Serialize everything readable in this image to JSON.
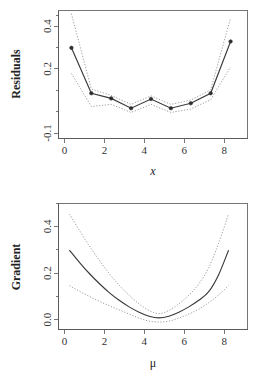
{
  "figure": {
    "panels": 2,
    "background": "#ffffff",
    "line_color": "#3a3a3a",
    "band_color": "#8a8a8a"
  },
  "chart_data": [
    {
      "type": "line",
      "panel_name": "residuals-panel",
      "title": "",
      "xlabel": "x",
      "ylabel": "Residuals",
      "xlim": [
        -0.55,
        8.95
      ],
      "ylim": [
        -0.13,
        0.47
      ],
      "grid": false,
      "legend": "none",
      "xticks": [
        0,
        2,
        4,
        6,
        8
      ],
      "xticklabels": [
        "0",
        "2",
        "4",
        "6",
        "8"
      ],
      "yticks": [
        -0.1,
        0.2,
        0.4
      ],
      "yticklabels": [
        "-0.1",
        "0.2",
        "0.4"
      ],
      "yticks_minor": [
        0.0,
        0.1,
        0.3
      ],
      "markers": "filled-circle",
      "x": [
        0.1,
        1.1,
        2.1,
        3.1,
        4.1,
        5.1,
        6.1,
        7.1,
        8.1
      ],
      "series": [
        {
          "name": "residuals",
          "style": "solid",
          "values": [
            0.295,
            0.082,
            0.058,
            0.012,
            0.055,
            0.012,
            0.035,
            0.082,
            0.325
          ]
        },
        {
          "name": "upper-band",
          "style": "dotted",
          "values": [
            0.455,
            0.102,
            0.072,
            0.03,
            0.07,
            0.03,
            0.05,
            0.098,
            0.435
          ]
        },
        {
          "name": "lower-band",
          "style": "dotted",
          "values": [
            0.175,
            0.02,
            0.03,
            -0.008,
            0.03,
            -0.008,
            0.008,
            0.052,
            0.205
          ]
        }
      ]
    },
    {
      "type": "line",
      "panel_name": "gradient-panel",
      "title": "",
      "xlabel": "μ",
      "ylabel": "Gradient",
      "xlim": [
        -0.55,
        8.95
      ],
      "ylim": [
        -0.04,
        0.5
      ],
      "grid": false,
      "legend": "none",
      "xticks": [
        0,
        2,
        4,
        6,
        8
      ],
      "xticklabels": [
        "0",
        "2",
        "4",
        "6",
        "8"
      ],
      "yticks": [
        0.0,
        0.2,
        0.4
      ],
      "yticklabels": [
        "0.0",
        "0.2",
        "0.4"
      ],
      "yticks_minor": [
        0.1,
        0.3
      ],
      "markers": "none",
      "x": [
        0,
        0.5,
        1,
        1.5,
        2,
        2.5,
        3,
        3.5,
        4,
        4.5,
        5,
        5.5,
        6,
        6.5,
        7,
        7.5,
        8
      ],
      "series": [
        {
          "name": "gradient",
          "style": "solid",
          "values": [
            0.3,
            0.248,
            0.2,
            0.157,
            0.118,
            0.085,
            0.057,
            0.034,
            0.017,
            0.01,
            0.017,
            0.034,
            0.057,
            0.085,
            0.122,
            0.195,
            0.3
          ]
        },
        {
          "name": "upper-band",
          "style": "dotted",
          "values": [
            0.455,
            0.385,
            0.318,
            0.257,
            0.2,
            0.15,
            0.107,
            0.07,
            0.042,
            0.028,
            0.042,
            0.07,
            0.107,
            0.155,
            0.225,
            0.33,
            0.455
          ]
        },
        {
          "name": "lower-band",
          "style": "dotted",
          "values": [
            0.148,
            0.124,
            0.102,
            0.081,
            0.062,
            0.044,
            0.026,
            0.009,
            -0.004,
            -0.008,
            -0.004,
            0.009,
            0.026,
            0.047,
            0.075,
            0.108,
            0.148
          ]
        }
      ]
    }
  ],
  "residuals": {
    "ylabel": "Residuals",
    "xlabel": "x",
    "yticklabels": [
      "0.4",
      "0.2",
      "-0.1"
    ],
    "xticklabels": [
      "0",
      "2",
      "4",
      "6",
      "8"
    ]
  },
  "gradient": {
    "ylabel": "Gradient",
    "xlabel": "μ",
    "yticklabels": [
      "0.4",
      "0.2",
      "0.0"
    ],
    "xticklabels": [
      "0",
      "2",
      "4",
      "6",
      "8"
    ]
  }
}
